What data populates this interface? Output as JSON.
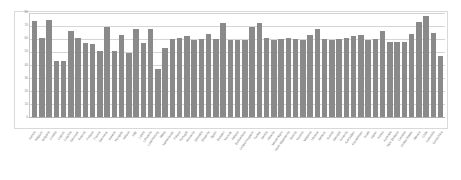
{
  "chart_data": {
    "type": "bar",
    "title": "",
    "subtitle": "",
    "xlabel": "",
    "ylabel": "",
    "ylim": [
      0,
      80
    ],
    "ytick_labels": [
      "80",
      "70",
      "60",
      "50",
      "40",
      "30",
      "20",
      "10",
      "0"
    ],
    "ytick_values": [
      80,
      70,
      60,
      50,
      40,
      30,
      20,
      10,
      0
    ],
    "grid": true,
    "legend": false,
    "legend_position": "none",
    "bar_color": "#8a8a8a",
    "gridline_color": "#d5d5d5",
    "frame_color": "#d9d9d9",
    "background_color": "#ffffff",
    "categories": [
      "Austria",
      "Belgium",
      "Bulgaria",
      "Croatia",
      "Cyprus",
      "Czechia",
      "Denmark",
      "Estonia",
      "Finland",
      "France",
      "Germany",
      "Greece",
      "Hungary",
      "Ireland",
      "Italy",
      "Latvia",
      "Lithuania",
      "Luxembourg",
      "Malta",
      "Netherlands",
      "Poland",
      "Portugal",
      "Romania",
      "Slovakia",
      "Slovenia",
      "Spain",
      "Sweden",
      "Norway",
      "Iceland",
      "Switzerland",
      "United Kingdom",
      "Turkey",
      "Serbia",
      "Albania",
      "Montenegro",
      "North Macedonia",
      "Bosnia",
      "Kosovo",
      "Moldova",
      "Ukraine",
      "Belarus",
      "Russia",
      "Georgia",
      "Armenia",
      "Azerbaijan",
      "Kazakhstan",
      "Israel",
      "Japan",
      "Korea",
      "Australia",
      "New Zealand",
      "Canada",
      "United States",
      "Mexico",
      "Chile",
      "Colombia",
      "Costa Rica"
    ],
    "values": [
      74,
      61,
      75,
      43,
      43,
      66,
      61,
      57,
      56,
      51,
      69,
      51,
      63,
      49,
      68,
      57,
      68,
      37,
      53,
      60,
      61,
      62,
      59,
      60,
      64,
      60,
      72,
      59,
      59,
      59,
      69,
      72,
      61,
      59,
      60,
      61,
      60,
      59,
      63,
      68,
      60,
      59,
      60,
      61,
      62,
      63,
      59,
      60,
      66,
      58,
      58,
      58,
      64,
      73,
      78,
      65,
      47
    ]
  }
}
